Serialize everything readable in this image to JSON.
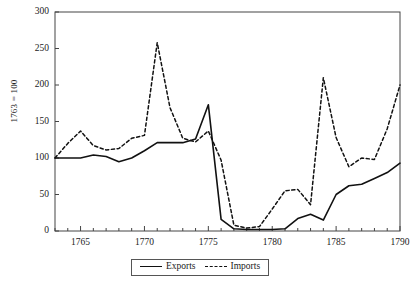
{
  "chart_data": {
    "type": "line",
    "title": "",
    "subtitle": "",
    "xlabel": "",
    "ylabel": "1763 = 100",
    "xlim": [
      1763,
      1790
    ],
    "ylim": [
      0,
      300
    ],
    "grid": false,
    "legend_position": "bottom-center",
    "x_ticks_major": [
      1765,
      1770,
      1775,
      1780,
      1785,
      1790
    ],
    "x_ticks_minor_step": 1,
    "y_ticks": [
      0,
      50,
      100,
      150,
      200,
      250,
      300
    ],
    "x": [
      1763,
      1764,
      1765,
      1766,
      1767,
      1768,
      1769,
      1770,
      1771,
      1772,
      1773,
      1774,
      1775,
      1776,
      1777,
      1778,
      1779,
      1780,
      1781,
      1782,
      1783,
      1784,
      1785,
      1786,
      1787,
      1788,
      1789,
      1790
    ],
    "series": [
      {
        "name": "Exports",
        "style": "solid",
        "color": "#111111",
        "values": [
          100,
          100,
          100,
          104,
          102,
          95,
          100,
          110,
          121,
          121,
          121,
          126,
          173,
          16,
          3,
          2,
          2,
          2,
          3,
          17,
          23,
          15,
          50,
          62,
          64,
          72,
          80,
          93
        ]
      },
      {
        "name": "Imports",
        "style": "dashed",
        "color": "#111111",
        "values": [
          100,
          120,
          137,
          117,
          111,
          113,
          127,
          131,
          258,
          169,
          127,
          122,
          137,
          97,
          8,
          4,
          6,
          30,
          55,
          57,
          36,
          210,
          128,
          88,
          100,
          98,
          140,
          200
        ]
      }
    ],
    "annotations": []
  },
  "legend": {
    "items": [
      {
        "label": "Exports",
        "style": "solid"
      },
      {
        "label": "Imports",
        "style": "dashed"
      }
    ]
  },
  "axis": {
    "y_title": "1763 = 100",
    "y_tick_labels": [
      "0",
      "50",
      "100",
      "150",
      "200",
      "250",
      "300"
    ],
    "x_tick_labels": [
      "1765",
      "1770",
      "1775",
      "1780",
      "1785",
      "1790"
    ]
  }
}
